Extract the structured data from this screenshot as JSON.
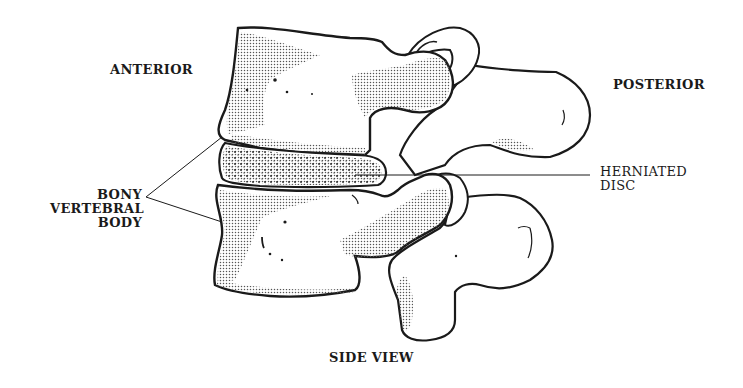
{
  "diagram": {
    "title": "SIDE VIEW",
    "labels": {
      "anterior": "ANTERIOR",
      "posterior": "POSTERIOR",
      "bony_vertebral_body": [
        "BONY",
        "VERTEBRAL",
        "BODY"
      ],
      "herniated_disc": [
        "HERNIATED",
        "DISC"
      ]
    },
    "structures": [
      "upper vertebral body",
      "lower vertebral body",
      "intervertebral disc (herniated)",
      "upper posterior process",
      "lower posterior process",
      "facet joints"
    ],
    "colors": {
      "ink": "#1a1a1a",
      "stipple": "#8a8a8a",
      "background": "#ffffff"
    }
  }
}
